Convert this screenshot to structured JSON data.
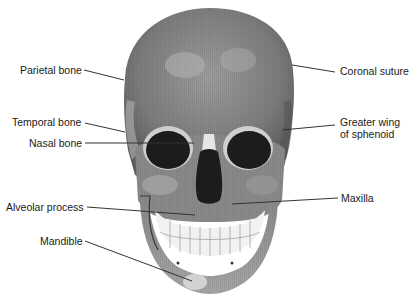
{
  "diagram": {
    "labels_left": [
      {
        "id": "parietal",
        "text": "Parietal bone"
      },
      {
        "id": "temporal",
        "text": "Temporal bone"
      },
      {
        "id": "nasal",
        "text": "Nasal bone"
      },
      {
        "id": "alveolar",
        "text": "Alveolar process"
      },
      {
        "id": "mandible",
        "text": "Mandible"
      }
    ],
    "labels_right": [
      {
        "id": "coronal",
        "text": "Coronal suture"
      },
      {
        "id": "sphenoid_1",
        "text": "Greater wing"
      },
      {
        "id": "sphenoid_2",
        "text": "of sphenoid"
      },
      {
        "id": "maxilla",
        "text": "Maxilla"
      }
    ],
    "colors": {
      "bone_dark": "#6e6e6e",
      "bone_mid": "#8f8f8f",
      "bone_light": "#bdbdbd",
      "cavity": "#1c1c1c",
      "teeth": "#f2f2f2",
      "leader_line": "#333333",
      "text": "#1a1a1a"
    }
  }
}
